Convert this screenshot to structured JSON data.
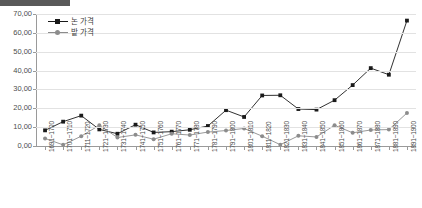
{
  "chart_data": {
    "type": "line",
    "title": "",
    "xlabel": "",
    "ylabel": "",
    "ylim": [
      0,
      70
    ],
    "ytick_step": 10,
    "ytick_labels": [
      "70,00",
      "60,00",
      "50,00",
      "40,00",
      "30,00",
      "20,00",
      "10,00",
      "0,00"
    ],
    "grid": true,
    "legend_position": "top-left",
    "categories": [
      "1691~1700",
      "1701~1710",
      "1711~1720",
      "1721~1730",
      "1731~1740",
      "1741~1750",
      "1751~1760",
      "1761~1770",
      "1771~1780",
      "1781~1790",
      "1791~1800",
      "1801~1810",
      "1811~1820",
      "1821~1830",
      "1831~1840",
      "1841~1850",
      "1851~1860",
      "1861~1870",
      "1871~1880",
      "1881~1890",
      "1891~1900"
    ],
    "series": [
      {
        "name": "논 가격",
        "color": "#1a1a1a",
        "marker": "square",
        "values": [
          8.3,
          12.9,
          16.1,
          8.8,
          6.5,
          11.3,
          7.2,
          7.6,
          8.6,
          10.6,
          19.0,
          15.4,
          26.8,
          26.9,
          19.6,
          19.3,
          24.3,
          32.3,
          41.3,
          37.8,
          66.5
        ]
      },
      {
        "name": "밭 가격",
        "color": "#8c8c8c",
        "marker": "circle",
        "values": [
          4.0,
          0.6,
          5.2,
          11.0,
          4.5,
          5.9,
          3.6,
          6.5,
          5.8,
          7.4,
          8.2,
          9.3,
          5.2,
          0.7,
          5.4,
          4.8,
          11.0,
          7.0,
          8.5,
          8.7,
          17.5
        ]
      }
    ]
  },
  "legend": {
    "items": [
      {
        "label": "논 가격"
      },
      {
        "label": "밭 가격"
      }
    ]
  }
}
